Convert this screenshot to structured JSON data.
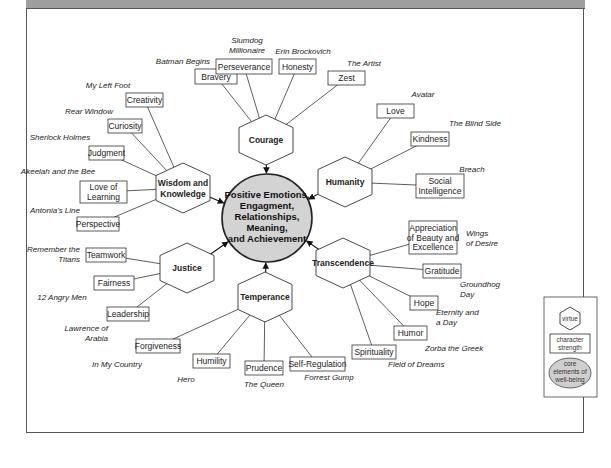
{
  "center": {
    "lines": [
      "Positive Emotions,",
      "Engagment,",
      "Relationships,",
      "Meaning,",
      "and Achievement"
    ],
    "fill": "#d3d3d3"
  },
  "virtues": [
    {
      "id": "courage",
      "label": [
        "Courage"
      ],
      "cx": 266,
      "cy": 140,
      "strengths": [
        {
          "label": [
            "Bravery"
          ],
          "x": 195,
          "y": 69,
          "w": 42,
          "h": 15,
          "film": [
            "Batman Begins"
          ],
          "fx": 183,
          "fy": 64,
          "anchor": "middle"
        },
        {
          "label": [
            "Perseverance"
          ],
          "x": 216,
          "y": 59,
          "w": 56,
          "h": 15,
          "film": [
            "Slumdog",
            "Millionaire"
          ],
          "fx": 247,
          "fy": 43,
          "anchor": "middle"
        },
        {
          "label": [
            "Honesty"
          ],
          "x": 279,
          "y": 59,
          "w": 37,
          "h": 15,
          "film": [
            "Erin Brockovich"
          ],
          "fx": 303,
          "fy": 54,
          "anchor": "middle"
        },
        {
          "label": [
            "Zest"
          ],
          "x": 328,
          "y": 71,
          "w": 37,
          "h": 14,
          "film": [
            "The Artist"
          ],
          "fx": 364,
          "fy": 66,
          "anchor": "middle"
        }
      ]
    },
    {
      "id": "humanity",
      "label": [
        "Humanity"
      ],
      "cx": 345,
      "cy": 182,
      "strengths": [
        {
          "label": [
            "Love"
          ],
          "x": 377,
          "y": 104,
          "w": 37,
          "h": 14,
          "film": [
            "Avatar"
          ],
          "fx": 423,
          "fy": 97,
          "anchor": "middle"
        },
        {
          "label": [
            "Kindness"
          ],
          "x": 411,
          "y": 132,
          "w": 38,
          "h": 14,
          "film": [
            "The Blind Side"
          ],
          "fx": 475,
          "fy": 126,
          "anchor": "middle"
        },
        {
          "label": [
            "Social",
            "Intelligence"
          ],
          "x": 416,
          "y": 174,
          "w": 48,
          "h": 24,
          "film": [
            "Breach"
          ],
          "fx": 472,
          "fy": 172,
          "anchor": "middle"
        }
      ]
    },
    {
      "id": "wisdom",
      "label": [
        "Wisdom and",
        "Knowledge"
      ],
      "cx": 183,
      "cy": 188,
      "strengths": [
        {
          "label": [
            "Creativity"
          ],
          "x": 126,
          "y": 93,
          "w": 37,
          "h": 14,
          "film": [
            "My Left Foot"
          ],
          "fx": 108,
          "fy": 88,
          "anchor": "middle"
        },
        {
          "label": [
            "Curiosity"
          ],
          "x": 108,
          "y": 119,
          "w": 34,
          "h": 14,
          "film": [
            "Rear Window"
          ],
          "fx": 89,
          "fy": 114,
          "anchor": "middle"
        },
        {
          "label": [
            "Judgment"
          ],
          "x": 89,
          "y": 146,
          "w": 35,
          "h": 14,
          "film": [
            "Sherlock Holmes"
          ],
          "fx": 60,
          "fy": 140,
          "anchor": "middle"
        },
        {
          "label": [
            "Love of",
            "Learning"
          ],
          "x": 80,
          "y": 181,
          "w": 47,
          "h": 22,
          "film": [
            "Akeelah and the Bee"
          ],
          "fx": 58,
          "fy": 174,
          "anchor": "middle"
        },
        {
          "label": [
            "Perspective"
          ],
          "x": 77,
          "y": 217,
          "w": 42,
          "h": 14,
          "film": [
            "Antonia's Line"
          ],
          "fx": 55,
          "fy": 213,
          "anchor": "middle"
        }
      ]
    },
    {
      "id": "justice",
      "label": [
        "Justice"
      ],
      "cx": 187,
      "cy": 268,
      "strengths": [
        {
          "label": [
            "Teamwork"
          ],
          "x": 86,
          "y": 248,
          "w": 40,
          "h": 14,
          "film": [
            "Remember the",
            "Titans"
          ],
          "fx": 80,
          "fy": 252,
          "anchor": "end"
        },
        {
          "label": [
            "Fairness"
          ],
          "x": 94,
          "y": 276,
          "w": 40,
          "h": 14,
          "film": [
            "12 Angry Men"
          ],
          "fx": 62,
          "fy": 300,
          "anchor": "middle"
        },
        {
          "label": [
            "Leadership"
          ],
          "x": 107,
          "y": 307,
          "w": 42,
          "h": 14,
          "film": [
            "Lawrence of",
            "Arabia"
          ],
          "fx": 108,
          "fy": 331,
          "anchor": "end"
        }
      ]
    },
    {
      "id": "temperance",
      "label": [
        "Temperance"
      ],
      "cx": 265,
      "cy": 297,
      "strengths": [
        {
          "label": [
            "Forgiveness"
          ],
          "x": 136,
          "y": 339,
          "w": 44,
          "h": 14,
          "film": [
            "In My Country"
          ],
          "fx": 117,
          "fy": 367,
          "anchor": "middle"
        },
        {
          "label": [
            "Humility"
          ],
          "x": 193,
          "y": 354,
          "w": 37,
          "h": 14,
          "film": [
            "Hero"
          ],
          "fx": 186,
          "fy": 382,
          "anchor": "middle"
        },
        {
          "label": [
            "Prudence"
          ],
          "x": 245,
          "y": 361,
          "w": 38,
          "h": 14,
          "film": [
            "The Queen"
          ],
          "fx": 264,
          "fy": 387,
          "anchor": "middle"
        },
        {
          "label": [
            "Self-Regulation"
          ],
          "x": 290,
          "y": 357,
          "w": 55,
          "h": 14,
          "film": [
            "Forrest Gump"
          ],
          "fx": 329,
          "fy": 380,
          "anchor": "middle"
        }
      ]
    },
    {
      "id": "transcendence",
      "label": [
        "Transcendence"
      ],
      "cx": 343,
      "cy": 263,
      "strengths": [
        {
          "label": [
            "Appreciation",
            "of Beauty and",
            "Excellence"
          ],
          "x": 409,
          "y": 221,
          "w": 48,
          "h": 33,
          "film": [
            "Wings",
            "of Desire"
          ],
          "fx": 466,
          "fy": 236,
          "anchor": "start"
        },
        {
          "label": [
            "Gratitude"
          ],
          "x": 423,
          "y": 264,
          "w": 38,
          "h": 14,
          "film": [
            "Groundhog",
            "Day"
          ],
          "fx": 460,
          "fy": 287,
          "anchor": "start"
        },
        {
          "label": [
            "Hope"
          ],
          "x": 410,
          "y": 296,
          "w": 28,
          "h": 14,
          "film": [
            "Eternity and",
            "a Day"
          ],
          "fx": 436,
          "fy": 315,
          "anchor": "start"
        },
        {
          "label": [
            "Humor"
          ],
          "x": 394,
          "y": 326,
          "w": 33,
          "h": 14,
          "film": [
            "Zorba the Greek"
          ],
          "fx": 425,
          "fy": 351,
          "anchor": "start"
        },
        {
          "label": [
            "Spirituality"
          ],
          "x": 352,
          "y": 345,
          "w": 44,
          "h": 14,
          "film": [
            "Field of Dreams"
          ],
          "fx": 388,
          "fy": 367,
          "anchor": "start"
        }
      ]
    }
  ],
  "legend": {
    "virtue": "virtue",
    "strength": [
      "character",
      "strength"
    ],
    "core": [
      "core",
      "elements of",
      "well-being"
    ]
  }
}
